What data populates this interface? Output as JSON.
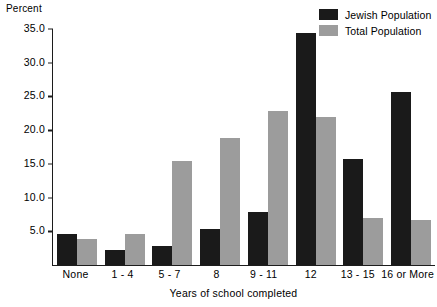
{
  "chart_data": {
    "type": "bar",
    "title": "",
    "ylabel": "Percent",
    "xlabel": "Years of school completed",
    "categories": [
      "None",
      "1 - 4",
      "5 - 7",
      "8",
      "9 - 11",
      "12",
      "13 - 15",
      "16 or More"
    ],
    "series": [
      {
        "name": "Jewish Population",
        "color": "#1a1a1a",
        "values": [
          4.6,
          2.2,
          2.8,
          5.4,
          7.9,
          34.4,
          15.7,
          25.7
        ]
      },
      {
        "name": "Total Population",
        "color": "#9c9c9c",
        "values": [
          3.9,
          4.6,
          15.4,
          18.8,
          22.8,
          22.0,
          6.9,
          6.7
        ]
      }
    ],
    "ylim": [
      0,
      35
    ],
    "yticks": [
      "5.0",
      "10.0",
      "15.0",
      "20.0",
      "25.0",
      "30.0",
      "35.0"
    ],
    "ytick_values": [
      5,
      10,
      15,
      20,
      25,
      30,
      35
    ],
    "grid": false,
    "legend_position": "top-right"
  }
}
